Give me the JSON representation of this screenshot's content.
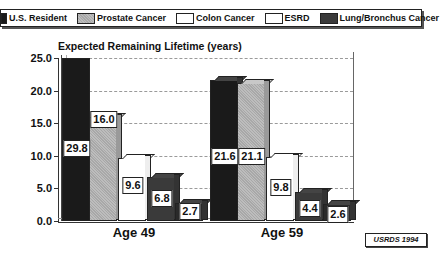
{
  "chart_data": {
    "type": "bar",
    "title": "Expected Remaining Lifetime (years)",
    "xlabel": "",
    "ylabel": "",
    "ylim": [
      0,
      25
    ],
    "yticks": [
      "0.0",
      "5.0",
      "10.0",
      "15.0",
      "20.0",
      "25.0"
    ],
    "grid": true,
    "legend_position": "top",
    "categories": [
      "Age 49",
      "Age 59"
    ],
    "series": [
      {
        "name": "U.S. Resident",
        "values": [
          29.8,
          21.6
        ],
        "color": "#1a1a1a"
      },
      {
        "name": "Prostate Cancer",
        "values": [
          16.0,
          21.1
        ],
        "color": "#b4b4b4"
      },
      {
        "name": "Colon Cancer",
        "values": [
          9.6,
          9.8
        ],
        "color": "#ffffff"
      },
      {
        "name": "ESRD",
        "values": [
          6.8,
          4.4
        ],
        "color": "#3a3a3a"
      },
      {
        "name": "Lung/Bronchus Cancer",
        "values": [
          2.7,
          2.6
        ],
        "color": "#2a2a2a"
      }
    ],
    "value_labels": [
      [
        "29.8",
        "16.0",
        "9.6",
        "6.8",
        "2.7"
      ],
      [
        "21.6",
        "21.1",
        "9.8",
        "4.4",
        "2.6"
      ]
    ],
    "annotations": [
      "USRDS 1994"
    ],
    "note": "Bars exceeding 25.0 are clipped at the top of the axis"
  },
  "legend": {
    "items": [
      {
        "label": "U.S. Resident",
        "color": "#1a1a1a"
      },
      {
        "label": "Prostate Cancer",
        "color": "#b4b4b4"
      },
      {
        "label": "Colon Cancer",
        "color": "#ffffff"
      },
      {
        "label": "ESRD",
        "color": "#ffffff"
      },
      {
        "label": "Lung/Bronchus Cancer",
        "color": "#3a3a3a"
      }
    ]
  },
  "source": "USRDS 1994"
}
